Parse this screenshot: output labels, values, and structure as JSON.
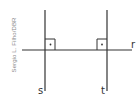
{
  "credit": "Sergio L. Filho/DBR",
  "lines": {
    "s": {
      "label": "s",
      "orientation": "vertical"
    },
    "t": {
      "label": "t",
      "orientation": "vertical"
    },
    "r": {
      "label": "r",
      "orientation": "horizontal"
    }
  },
  "right_angles": [
    {
      "between": [
        "s",
        "r"
      ],
      "marker": "right-angle-square-with-dot"
    },
    {
      "between": [
        "t",
        "r"
      ],
      "marker": "right-angle-square-with-dot"
    }
  ],
  "colors": {
    "line": "#333333",
    "credit": "#8a8a8a",
    "background": "#ffffff"
  }
}
